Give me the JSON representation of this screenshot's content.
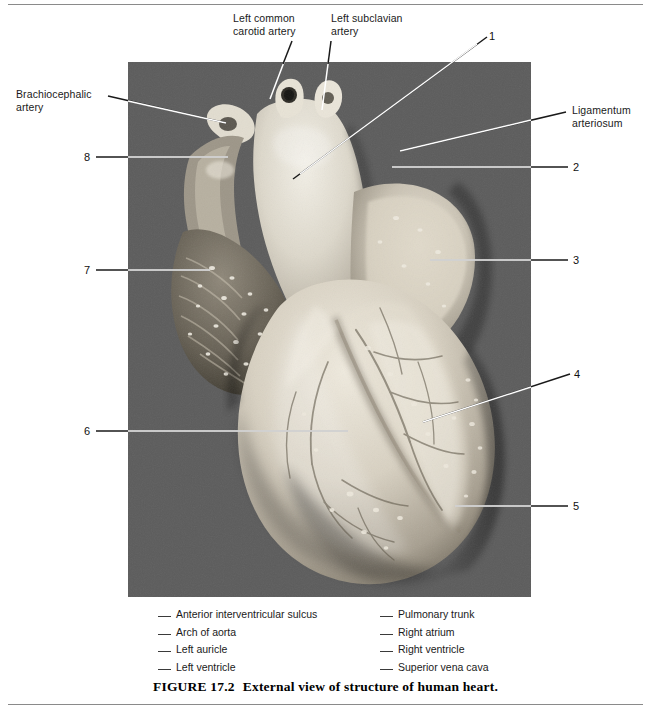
{
  "figure": {
    "number_label": "FIGURE  17.2",
    "caption": "External view of structure of human heart.",
    "background_color": "#5a5a5a",
    "rule_color": "#8a8a8a"
  },
  "named_labels": [
    {
      "id": "left-common-carotid-artery",
      "text": "Left common\ncarotid artery"
    },
    {
      "id": "left-subclavian-artery",
      "text": "Left subclavian\nartery"
    },
    {
      "id": "brachiocephalic-artery",
      "text": "Brachiocephalic\nartery"
    },
    {
      "id": "ligamentum-arteriosum",
      "text": "Ligamentum\narteriosum"
    }
  ],
  "numbered_labels": [
    {
      "id": "callout-1",
      "text": "1"
    },
    {
      "id": "callout-2",
      "text": "2"
    },
    {
      "id": "callout-3",
      "text": "3"
    },
    {
      "id": "callout-4",
      "text": "4"
    },
    {
      "id": "callout-5",
      "text": "5"
    },
    {
      "id": "callout-6",
      "text": "6"
    },
    {
      "id": "callout-7",
      "text": "7"
    },
    {
      "id": "callout-8",
      "text": "8"
    }
  ],
  "legend": {
    "column1": [
      "Anterior interventricular sulcus",
      "Arch of aorta",
      "Left auricle",
      "Left ventricle"
    ],
    "column2": [
      "Pulmonary trunk",
      "Right atrium",
      "Right ventricle",
      "Superior vena cava"
    ]
  }
}
